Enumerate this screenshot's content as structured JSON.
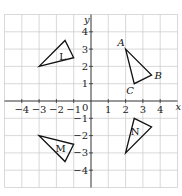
{
  "diagram": {
    "type": "coordinate-plane",
    "x_range": [
      -5,
      5
    ],
    "y_range": [
      -5,
      5
    ],
    "origin_px": [
      91,
      101
    ],
    "unit_px": 17.3,
    "axis_labels": {
      "x": "x",
      "y": "y"
    },
    "origin_label": "0",
    "x_ticks": [
      {
        "value": -4,
        "label": "−4"
      },
      {
        "value": -3,
        "label": "−3"
      },
      {
        "value": -2,
        "label": "−2"
      },
      {
        "value": -1,
        "label": "−1"
      },
      {
        "value": 1,
        "label": "1"
      },
      {
        "value": 2,
        "label": "2"
      },
      {
        "value": 3,
        "label": "3"
      },
      {
        "value": 4,
        "label": "4"
      }
    ],
    "y_ticks": [
      {
        "value": 4,
        "label": "4"
      },
      {
        "value": 3,
        "label": "3"
      },
      {
        "value": 2,
        "label": "2"
      },
      {
        "value": 1,
        "label": "1"
      },
      {
        "value": -1,
        "label": "−1"
      },
      {
        "value": -2,
        "label": "−2"
      },
      {
        "value": -3,
        "label": "−3"
      },
      {
        "value": -4,
        "label": "−4"
      }
    ],
    "colors": {
      "grid": "#c9c9c9",
      "axis": "#333333",
      "shape": "#111111"
    },
    "shapes": [
      {
        "name": "ABC",
        "points": [
          [
            2,
            3
          ],
          [
            3.5,
            1.5
          ],
          [
            2.5,
            1
          ]
        ],
        "vertex_labels": [
          {
            "text": "A",
            "at": [
              2,
              3
            ],
            "offset": [
              -8,
              -3
            ]
          },
          {
            "text": "B",
            "at": [
              3.5,
              1.5
            ],
            "offset": [
              3,
              4
            ]
          },
          {
            "text": "C",
            "at": [
              2.5,
              1
            ],
            "offset": [
              -8,
              10
            ]
          }
        ]
      },
      {
        "name": "L",
        "label": "L",
        "label_at": [
          -1.65,
          2.55
        ],
        "points": [
          [
            -3,
            2
          ],
          [
            -1.5,
            3.5
          ],
          [
            -1,
            2.5
          ]
        ]
      },
      {
        "name": "M",
        "label": "M",
        "label_at": [
          -1.75,
          -2.75
        ],
        "points": [
          [
            -3,
            -2
          ],
          [
            -1,
            -2.5
          ],
          [
            -1.5,
            -3.5
          ]
        ]
      },
      {
        "name": "N",
        "label": "N",
        "label_at": [
          2.55,
          -1.75
        ],
        "points": [
          [
            2.5,
            -1
          ],
          [
            3.5,
            -1.5
          ],
          [
            2,
            -3
          ]
        ]
      }
    ]
  }
}
